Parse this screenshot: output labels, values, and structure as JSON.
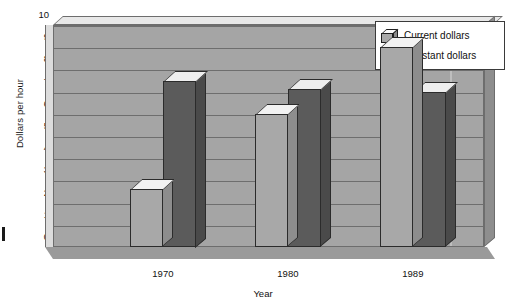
{
  "chart_data": {
    "type": "bar",
    "title": "",
    "subtitle": "",
    "xlabel": "Year",
    "ylabel": "Dollars per hour",
    "categories": [
      "1970",
      "1980",
      "1989"
    ],
    "series": [
      {
        "name": "Current dollars",
        "values": [
          2.6,
          6.0,
          9.0
        ],
        "color": "#a8a8a8"
      },
      {
        "name": "Constant dollars",
        "values": [
          7.5,
          7.1,
          7.0
        ],
        "color": "#5b5b5b"
      }
    ],
    "ylim": [
      0,
      10
    ],
    "ytick_labels": [
      "0",
      "1",
      "2",
      "3",
      "4",
      "5",
      "6",
      "7",
      "8",
      "9",
      "10"
    ],
    "ytick_values": [
      0,
      1,
      2,
      3,
      4,
      5,
      6,
      7,
      8,
      9,
      10
    ],
    "grid": true,
    "grid_axis": "y",
    "legend_position": "top-right",
    "style": "3d-grouped-bar"
  },
  "legend": {
    "entries": [
      {
        "label": "Current dollars"
      },
      {
        "label": "Constant dollars"
      }
    ]
  },
  "axes": {
    "y_title": "Dollars per hour",
    "x_title": "Year"
  },
  "colors": {
    "current_dollars": "#a8a8a8",
    "constant_dollars": "#5b5b5b",
    "plot_background": "#a5a5a5",
    "gridline": "#6e6e6e",
    "page_background": "#ffffff"
  }
}
